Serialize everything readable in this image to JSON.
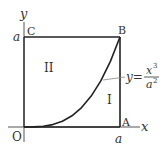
{
  "diagram": {
    "axes": {
      "x_label": "x",
      "y_label": "y"
    },
    "points": {
      "origin": "O",
      "A": "A",
      "B": "B",
      "C": "C"
    },
    "tick_labels": {
      "x_a": "a",
      "y_a": "a"
    },
    "regions": {
      "upper_left": "II",
      "lower_right": "I"
    },
    "curve": {
      "equation_lhs": "y=",
      "numerator": "x",
      "numerator_exp": "3",
      "denominator": "a",
      "denominator_exp": "2"
    },
    "colors": {
      "line": "#222222",
      "text": "#333333",
      "leader": "#888888"
    }
  }
}
